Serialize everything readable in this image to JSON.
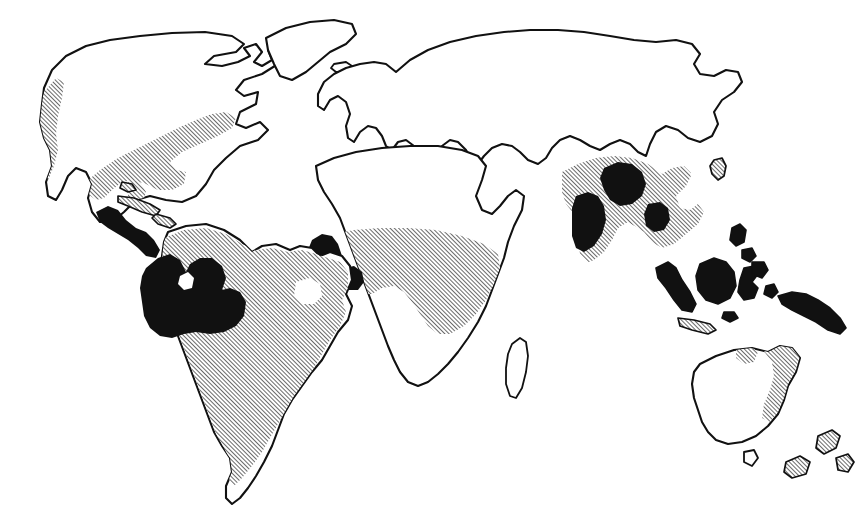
{
  "figure": {
    "kind": "world-distribution-map",
    "projection": "equirectangular-sketch",
    "background_color": "#ffffff",
    "ink_color": "#111111",
    "width": 867,
    "height": 529,
    "title": "",
    "caption": "",
    "has_frame": false,
    "has_graticule": false,
    "has_labels": false
  },
  "legend": {
    "visible": false,
    "entries": [
      {
        "key": "core",
        "swatch": "solid-black",
        "color": "#111111",
        "label": ""
      },
      {
        "key": "range",
        "swatch": "diagonal-hatch",
        "color": "#111111",
        "label": ""
      }
    ]
  },
  "symbology": {
    "hatch_angle_deg": 45,
    "hatch_spacing_px": 3,
    "hatch_line_width_px": 1.2,
    "coast_stroke_px": 2.1
  },
  "landmasses": [
    {
      "id": "north-america",
      "name": "North America",
      "shading": "partial"
    },
    {
      "id": "greenland",
      "name": "Greenland",
      "shading": "none"
    },
    {
      "id": "iceland",
      "name": "Iceland",
      "shading": "none"
    },
    {
      "id": "south-america",
      "name": "South America",
      "shading": "hatched-with-core"
    },
    {
      "id": "eurasia",
      "name": "Eurasia",
      "shading": "partial"
    },
    {
      "id": "africa",
      "name": "Africa",
      "shading": "hatched-with-core"
    },
    {
      "id": "madagascar",
      "name": "Madagascar",
      "shading": "none"
    },
    {
      "id": "australia",
      "name": "Australia",
      "shading": "partial"
    },
    {
      "id": "new-zealand",
      "name": "New Zealand",
      "shading": "hatched"
    }
  ],
  "shaded_regions": [
    {
      "id": "na-southeast-band",
      "region": "Southeastern North America",
      "type": "hatched"
    },
    {
      "id": "na-pacific-coast",
      "region": "Pacific coast of North America",
      "type": "hatched"
    },
    {
      "id": "central-america",
      "region": "Central America",
      "type": "core"
    },
    {
      "id": "caribbean-cuba",
      "region": "Cuba",
      "type": "hatched"
    },
    {
      "id": "caribbean-hispaniola",
      "region": "Hispaniola",
      "type": "hatched"
    },
    {
      "id": "amazon-basin",
      "region": "Amazon Basin",
      "type": "core"
    },
    {
      "id": "south-america-range",
      "region": "Tropical South America",
      "type": "hatched"
    },
    {
      "id": "west-africa-coast",
      "region": "West African coast",
      "type": "core"
    },
    {
      "id": "congo-basin",
      "region": "Congo Basin and equatorial Africa",
      "type": "hatched"
    },
    {
      "id": "india-west-ghats",
      "region": "Western India",
      "type": "core"
    },
    {
      "id": "india-northeast",
      "region": "Northeastern India",
      "type": "core"
    },
    {
      "id": "south-asia-range",
      "region": "South and Southeast Asia",
      "type": "hatched"
    },
    {
      "id": "sumatra",
      "region": "Sumatra",
      "type": "core"
    },
    {
      "id": "borneo",
      "region": "Borneo",
      "type": "core"
    },
    {
      "id": "sulawesi",
      "region": "Sulawesi",
      "type": "core"
    },
    {
      "id": "java",
      "region": "Java",
      "type": "hatched"
    },
    {
      "id": "philippines",
      "region": "Philippines",
      "type": "core"
    },
    {
      "id": "new-guinea",
      "region": "New Guinea",
      "type": "core"
    },
    {
      "id": "taiwan",
      "region": "Taiwan",
      "type": "hatched"
    },
    {
      "id": "queensland-coast",
      "region": "Northeastern Australia",
      "type": "hatched"
    },
    {
      "id": "new-zealand-isles",
      "region": "New Zealand",
      "type": "hatched"
    }
  ]
}
